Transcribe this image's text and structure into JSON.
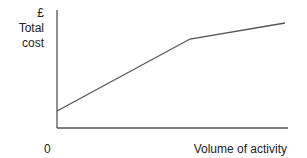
{
  "chart_data": {
    "type": "line",
    "title": "",
    "xlabel": "Volume of activity",
    "ylabel_currency": "£",
    "ylabel": "Total cost",
    "origin_label": "0",
    "grid": false,
    "legend": null,
    "series": [
      {
        "name": "Total cost",
        "points_px": [
          [
            57,
            111
          ],
          [
            190,
            39
          ],
          [
            285,
            23
          ]
        ],
        "description": "Steep rise to a kink, then a flatter slope"
      }
    ],
    "axes_px": {
      "origin": [
        57,
        128
      ],
      "y_top": [
        57,
        10
      ],
      "x_end": [
        288,
        128
      ]
    },
    "colors": {
      "axis": "#555555",
      "line": "#555555"
    }
  }
}
